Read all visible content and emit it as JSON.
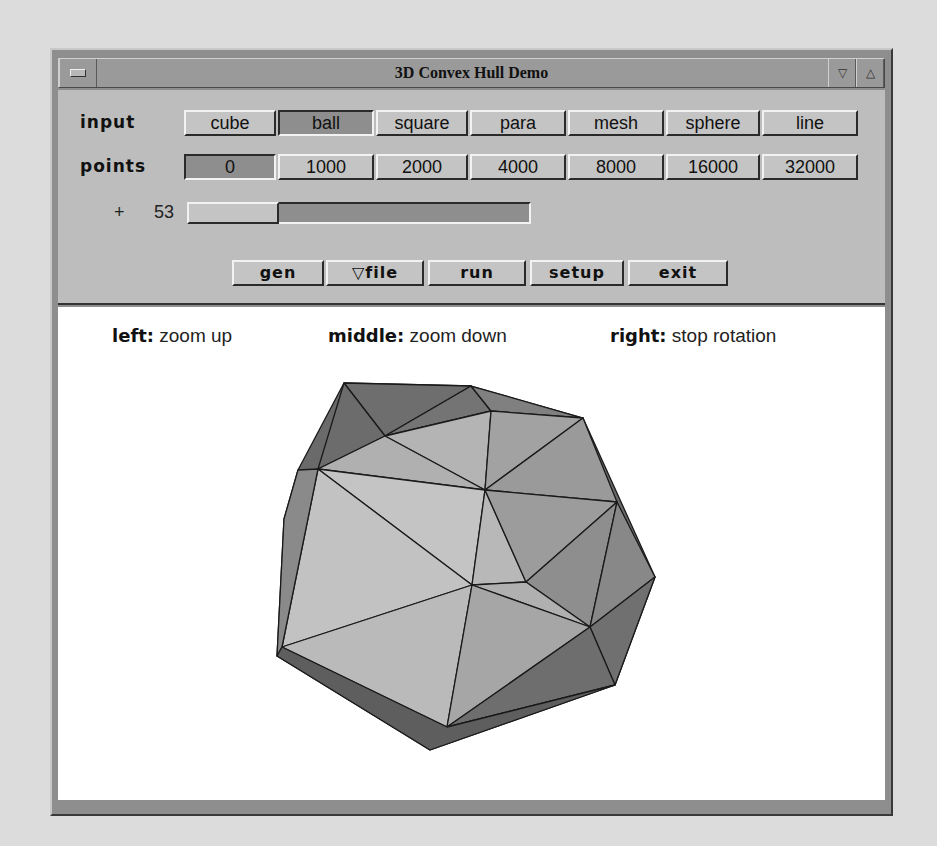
{
  "window": {
    "title": "3D Convex Hull Demo",
    "menu_icon": "window-menu-icon",
    "minimize_icon": "▽",
    "maximize_icon": "△"
  },
  "controls": {
    "input_label": "input",
    "input_options": [
      {
        "label": "cube",
        "active": false
      },
      {
        "label": "ball",
        "active": true
      },
      {
        "label": "square",
        "active": false
      },
      {
        "label": "para",
        "active": false
      },
      {
        "label": "mesh",
        "active": false
      },
      {
        "label": "sphere",
        "active": false
      },
      {
        "label": "line",
        "active": false
      }
    ],
    "points_label": "points",
    "points_options": [
      {
        "label": "0",
        "active": true
      },
      {
        "label": "1000",
        "active": false
      },
      {
        "label": "2000",
        "active": false
      },
      {
        "label": "4000",
        "active": false
      },
      {
        "label": "8000",
        "active": false
      },
      {
        "label": "16000",
        "active": false
      },
      {
        "label": "32000",
        "active": false
      }
    ],
    "slider": {
      "prefix": "+",
      "value": "53"
    },
    "actions": [
      {
        "label": "gen"
      },
      {
        "label": "▽file"
      },
      {
        "label": "run"
      },
      {
        "label": "setup"
      },
      {
        "label": "exit"
      }
    ]
  },
  "canvas": {
    "hints": [
      {
        "key": "left:",
        "text": " zoom up"
      },
      {
        "key": "middle:",
        "text": " zoom down"
      },
      {
        "key": "right:",
        "text": " stop rotation"
      }
    ],
    "colors": {
      "light": "#c2c2c2",
      "mid": "#a9a9a9",
      "dark": "#8a8a8a",
      "darker": "#6a6a6a",
      "edge": "#1a1a1a"
    }
  }
}
